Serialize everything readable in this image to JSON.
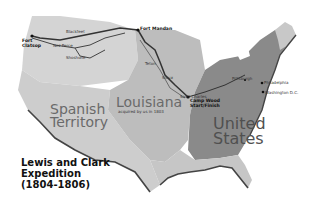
{
  "title": {
    "line1": "Lewis and Clark",
    "line2": "Expedition",
    "line3": "(1804-1806)"
  },
  "regions": {
    "spanish": {
      "line1": "Spanish",
      "line2": "Territory",
      "color": "#cdcdcd"
    },
    "louisiana": {
      "name": "Louisiana",
      "subtitle": "acquired by us in 1803",
      "color": "#bdbdbd"
    },
    "united_states": {
      "line1": "United",
      "line2": "States",
      "color": "#8a8a8a"
    },
    "northwest": {
      "color": "#d4d4d4"
    },
    "maine": {
      "color": "#c8c8c8"
    }
  },
  "places": {
    "fort_clatsop": {
      "line1": "Fort",
      "line2": "Clatsop"
    },
    "fort_mandan": "Fort Mandan",
    "camp_wood": {
      "line1": "Camp Wood",
      "line2": "Start/Finish"
    },
    "st_charles": "Saint Charles",
    "pittsburgh": "Pittsburgh",
    "philadelphia": "Philadelphia",
    "washington": "Washington D.C.",
    "blackfeet": "Blackfeet",
    "nez_perce": "Nez Perce",
    "shoshone": "Shoshone",
    "sioux": "Sioux",
    "teton": "Teton"
  },
  "colors": {
    "route": "#333333",
    "coast": "#444444",
    "background": "#ffffff"
  }
}
